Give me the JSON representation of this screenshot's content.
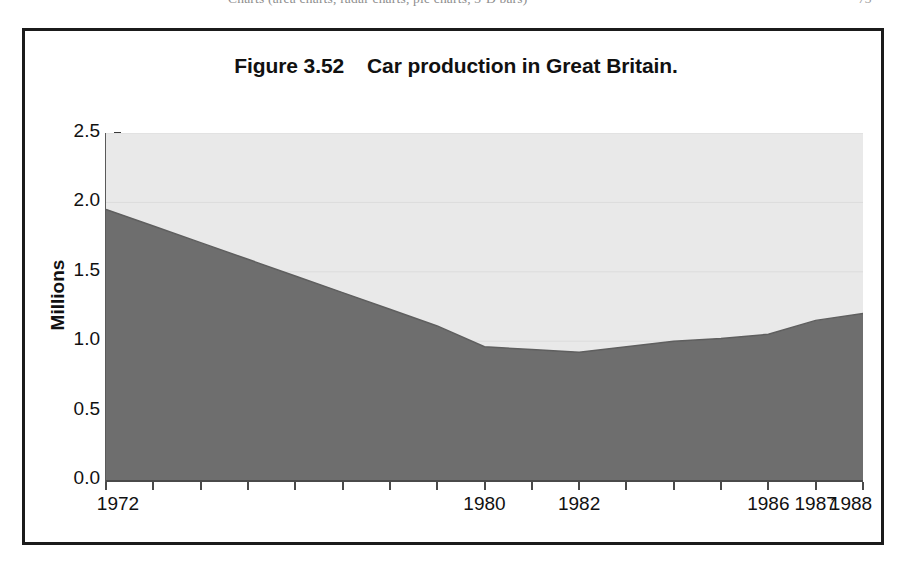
{
  "page": {
    "header_text": "Charts (area charts, radar charts, pie charts, 3-D bars)",
    "header_number": "73"
  },
  "figure": {
    "title": "Figure 3.52    Car production in Great Britain.",
    "label": "Figure 3.52",
    "caption": "Car production in Great Britain."
  },
  "colors": {
    "area_fill": "#6e6e6e",
    "plot_background": "#e9e9e9",
    "frame_border": "#1b1b1b",
    "axis": "#4a4a4a",
    "gridline": "#dcdcdc",
    "text": "#111111"
  },
  "chart_data": {
    "type": "area",
    "title": "Car production in Great Britain.",
    "xlabel": "",
    "ylabel": "Millions",
    "ylim": [
      0.0,
      2.5
    ],
    "xlim": [
      1972,
      1988
    ],
    "grid": false,
    "legend": "none",
    "y_ticks": [
      "2.5",
      "2.0",
      "1.5",
      "1.0",
      "0.5",
      "0.0"
    ],
    "y_tick_values": [
      2.5,
      2.0,
      1.5,
      1.0,
      0.5,
      0.0
    ],
    "x_tick_labels": [
      "1972",
      "1980",
      "1982",
      "1986",
      "1987",
      "1988"
    ],
    "x_labelled_years": [
      1972,
      1980,
      1982,
      1986,
      1987,
      1988
    ],
    "x_all_ticks": [
      1972,
      1973,
      1974,
      1975,
      1976,
      1977,
      1978,
      1979,
      1980,
      1981,
      1982,
      1983,
      1984,
      1985,
      1986,
      1987,
      1988
    ],
    "categories": [
      1972,
      1973,
      1974,
      1975,
      1976,
      1977,
      1978,
      1979,
      1980,
      1981,
      1982,
      1983,
      1984,
      1985,
      1986,
      1987,
      1988
    ],
    "values": [
      1.95,
      1.83,
      1.71,
      1.59,
      1.47,
      1.35,
      1.23,
      1.11,
      0.96,
      0.94,
      0.92,
      0.96,
      1.0,
      1.02,
      1.05,
      1.15,
      1.2
    ],
    "units": "Millions"
  }
}
